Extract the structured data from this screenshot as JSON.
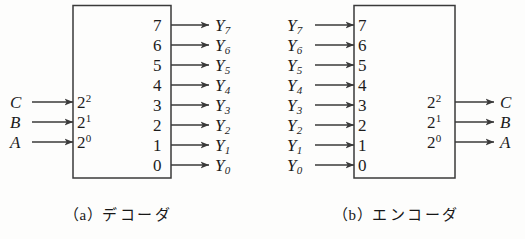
{
  "figure": {
    "background_color": "#fdfdfc",
    "line_color": "#3a3a3a",
    "text_color": "#1c1c1c"
  },
  "decoder": {
    "caption": "（a）デコーダ",
    "caption_index": "（a）",
    "caption_name": "デコーダ",
    "inputs": [
      {
        "signal": "C",
        "weight_base": "2",
        "weight_exp": "2"
      },
      {
        "signal": "B",
        "weight_base": "2",
        "weight_exp": "1"
      },
      {
        "signal": "A",
        "weight_base": "2",
        "weight_exp": "0"
      }
    ],
    "outputs": [
      {
        "pin": "7",
        "signal": "Y",
        "sub": "7"
      },
      {
        "pin": "6",
        "signal": "Y",
        "sub": "6"
      },
      {
        "pin": "5",
        "signal": "Y",
        "sub": "5"
      },
      {
        "pin": "4",
        "signal": "Y",
        "sub": "4"
      },
      {
        "pin": "3",
        "signal": "Y",
        "sub": "3"
      },
      {
        "pin": "2",
        "signal": "Y",
        "sub": "2"
      },
      {
        "pin": "1",
        "signal": "Y",
        "sub": "1"
      },
      {
        "pin": "0",
        "signal": "Y",
        "sub": "0"
      }
    ]
  },
  "encoder": {
    "caption": "（b）エンコーダ",
    "caption_index": "（b）",
    "caption_name": "エンコーダ",
    "inputs": [
      {
        "pin": "7",
        "signal": "Y",
        "sub": "7"
      },
      {
        "pin": "6",
        "signal": "Y",
        "sub": "6"
      },
      {
        "pin": "5",
        "signal": "Y",
        "sub": "5"
      },
      {
        "pin": "4",
        "signal": "Y",
        "sub": "4"
      },
      {
        "pin": "3",
        "signal": "Y",
        "sub": "3"
      },
      {
        "pin": "2",
        "signal": "Y",
        "sub": "2"
      },
      {
        "pin": "1",
        "signal": "Y",
        "sub": "1"
      },
      {
        "pin": "0",
        "signal": "Y",
        "sub": "0"
      }
    ],
    "outputs": [
      {
        "signal": "C",
        "weight_base": "2",
        "weight_exp": "2"
      },
      {
        "signal": "B",
        "weight_base": "2",
        "weight_exp": "1"
      },
      {
        "signal": "A",
        "weight_base": "2",
        "weight_exp": "0"
      }
    ]
  }
}
